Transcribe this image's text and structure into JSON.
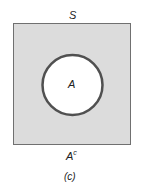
{
  "diagram": {
    "type": "venn",
    "universe_label": "S",
    "set_label": "A",
    "complement_label": "A",
    "complement_superscript": "c",
    "caption": "(c)",
    "colors": {
      "universe_fill": "#dcdcdc",
      "universe_border": "#707070",
      "circle_fill": "#ffffff",
      "circle_border": "#505050"
    }
  }
}
